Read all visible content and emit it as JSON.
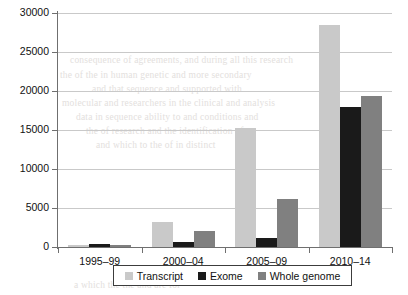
{
  "chart_data": {
    "type": "bar",
    "title": "",
    "subtitle": "",
    "xlabel": "",
    "ylabel": "",
    "categories": [
      "1995–99",
      "2000–04",
      "2005–09",
      "2010–14"
    ],
    "series": [
      {
        "name": "Transcript",
        "color": "#c9c9c9",
        "values": [
          250,
          3200,
          15200,
          28500
        ]
      },
      {
        "name": "Exome",
        "color": "#1a1a1a",
        "values": [
          380,
          700,
          1100,
          18000
        ]
      },
      {
        "name": "Whole genome",
        "color": "#808080",
        "values": [
          200,
          2100,
          6200,
          19400
        ]
      }
    ],
    "ylim": [
      0,
      30000
    ],
    "ytick_values": [
      0,
      5000,
      10000,
      15000,
      20000,
      25000,
      30000
    ],
    "ytick_labels": [
      "0",
      "5000",
      "10000",
      "15000",
      "20000",
      "25000",
      "30000"
    ],
    "grid": true,
    "grid_axis": "y",
    "legend_position": "bottom",
    "legend_entries": [
      "Transcript",
      "Exome",
      "Whole genome"
    ]
  },
  "legend": {
    "items": [
      {
        "label": "Transcript",
        "color": "#c9c9c9"
      },
      {
        "label": "Exome",
        "color": "#1a1a1a"
      },
      {
        "label": "Whole genome",
        "color": "#808080"
      }
    ]
  },
  "bleed_text": [
    {
      "text": "consequence of agreements, and during all this research",
      "x": 70,
      "y": 55
    },
    {
      "text": "the of the in human genetic and more secondary",
      "x": 60,
      "y": 70
    },
    {
      "text": "and that sequence and supported with",
      "x": 92,
      "y": 84
    },
    {
      "text": "molecular and researchers in the clinical and analysis",
      "x": 62,
      "y": 98
    },
    {
      "text": "data in sequence ability to and conditions and",
      "x": 76,
      "y": 112
    },
    {
      "text": "the of research and the identification of",
      "x": 86,
      "y": 126
    },
    {
      "text": "and which to the of in distinct",
      "x": 96,
      "y": 140
    },
    {
      "text": "a which the the and are for",
      "x": 74,
      "y": 280
    }
  ]
}
